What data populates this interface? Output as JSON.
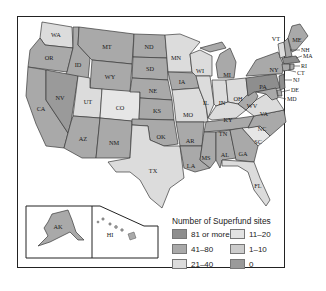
{
  "legend": {
    "title": "Number of Superfund sites",
    "items": [
      {
        "label": "81 or more",
        "color": "#8e8e8e"
      },
      {
        "label": "11–20",
        "color": "#e3e3e3"
      },
      {
        "label": "41–80",
        "color": "#a9a9a9"
      },
      {
        "label": "1–10",
        "color": "#cccccc"
      },
      {
        "label": "21–40",
        "color": "#dcdcdc"
      },
      {
        "label": "0",
        "color": "#9a9a9a"
      }
    ]
  },
  "colors": {
    "c81": "#8e8e8e",
    "c41": "#a9a9a9",
    "c21": "#dcdcdc",
    "c11": "#e6e6e6",
    "c1": "#bdbdbd",
    "water": "#ffffff"
  },
  "states": {
    "WA": "WA",
    "OR": "OR",
    "CA": "CA",
    "ID": "ID",
    "NV": "NV",
    "MT": "MT",
    "WY": "WY",
    "UT": "UT",
    "AZ": "AZ",
    "CO": "CO",
    "NM": "NM",
    "ND": "ND",
    "SD": "SD",
    "NE": "NE",
    "KS": "KS",
    "OK": "OK",
    "TX": "TX",
    "MN": "MN",
    "IA": "IA",
    "MO": "MO",
    "AR": "AR",
    "LA": "LA",
    "WI": "WI",
    "IL": "IL",
    "MI": "MI",
    "IN": "IN",
    "OH": "OH",
    "KY": "KY",
    "TN": "TN",
    "MS": "MS",
    "AL": "AL",
    "GA": "GA",
    "FL": "FL",
    "SC": "SC",
    "NC": "NC",
    "VA": "VA",
    "WV": "WV",
    "PA": "PA",
    "NY": "NY",
    "VT": "VT",
    "ME": "ME",
    "NH": "NH",
    "MA": "MA",
    "RI": "RI",
    "CT": "CT",
    "NJ": "NJ",
    "DE": "DE",
    "MD": "MD",
    "AK": "AK",
    "HI": "HI"
  }
}
